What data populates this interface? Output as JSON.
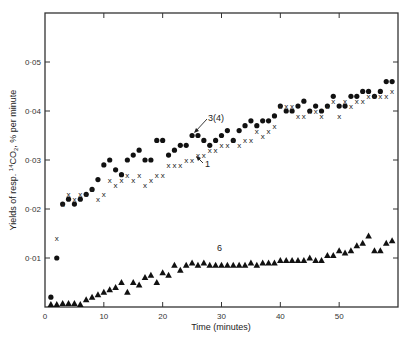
{
  "chart_data": {
    "type": "scatter",
    "title": "",
    "xlabel": "Time (minutes)",
    "ylabel": "Yields of resp. 14CO2, % per minute",
    "xlim": [
      0,
      60
    ],
    "ylim": [
      0,
      0.06
    ],
    "x_ticks": [
      0,
      10,
      20,
      30,
      40,
      50
    ],
    "x_tick_labels": [
      "0",
      "10",
      "20",
      "30",
      "40",
      "50"
    ],
    "y_ticks": [
      0.01,
      0.02,
      0.03,
      0.04,
      0.05
    ],
    "y_tick_labels": [
      "0·01",
      "0·02",
      "0·03",
      "0·04",
      "0·05"
    ],
    "grid": false,
    "legend": "none (inline annotations)",
    "annotations": [
      {
        "text": "3(4)",
        "x": 26,
        "y": 0.037,
        "arrow_to": [
          24,
          0.035
        ]
      },
      {
        "text": "1",
        "x": 27,
        "y": 0.031,
        "arrow_to": [
          25.5,
          0.033
        ]
      },
      {
        "text": "6",
        "x": 25,
        "y": 0.0125
      }
    ],
    "series": [
      {
        "name": "3(4)",
        "marker": "filled circle",
        "x": [
          1,
          2,
          3,
          4,
          5,
          6,
          7,
          8,
          9,
          10,
          11,
          12,
          13,
          14,
          15,
          16,
          17,
          18,
          19,
          20,
          21,
          22,
          23,
          24,
          25,
          26,
          27,
          28,
          29,
          30,
          31,
          32,
          33,
          34,
          35,
          36,
          37,
          38,
          39,
          40,
          41,
          42,
          43,
          44,
          45,
          46,
          47,
          48,
          49,
          50,
          51,
          52,
          53,
          54,
          55,
          56,
          57,
          58,
          59
        ],
        "y": [
          0.002,
          0.01,
          0.021,
          0.022,
          0.021,
          0.022,
          0.023,
          0.024,
          0.026,
          0.029,
          0.03,
          0.028,
          0.027,
          0.03,
          0.031,
          0.032,
          0.03,
          0.03,
          0.034,
          0.034,
          0.031,
          0.032,
          0.033,
          0.033,
          0.035,
          0.035,
          0.034,
          0.033,
          0.034,
          0.035,
          0.036,
          0.034,
          0.036,
          0.037,
          0.038,
          0.037,
          0.038,
          0.038,
          0.039,
          0.041,
          0.04,
          0.04,
          0.041,
          0.042,
          0.04,
          0.041,
          0.04,
          0.041,
          0.043,
          0.041,
          0.041,
          0.043,
          0.043,
          0.044,
          0.044,
          0.043,
          0.044,
          0.046,
          0.046
        ]
      },
      {
        "name": "1",
        "marker": "x",
        "x": [
          2,
          3,
          4,
          5,
          6,
          7,
          8,
          9,
          10,
          11,
          12,
          13,
          14,
          15,
          16,
          17,
          18,
          19,
          20,
          21,
          22,
          23,
          24,
          25,
          26,
          27,
          28,
          29,
          30,
          31,
          32,
          33,
          34,
          35,
          36,
          37,
          38,
          39,
          40,
          41,
          42,
          43,
          44,
          45,
          46,
          47,
          48,
          49,
          50,
          51,
          52,
          53,
          54,
          55,
          56,
          57,
          58,
          59
        ],
        "y": [
          0.014,
          0.021,
          0.023,
          0.022,
          0.023,
          0.023,
          0.024,
          0.022,
          0.023,
          0.026,
          0.025,
          0.026,
          0.027,
          0.026,
          0.027,
          0.025,
          0.026,
          0.027,
          0.027,
          0.029,
          0.029,
          0.029,
          0.03,
          0.03,
          0.031,
          0.031,
          0.032,
          0.032,
          0.033,
          0.033,
          0.034,
          0.033,
          0.034,
          0.034,
          0.036,
          0.035,
          0.036,
          0.037,
          0.041,
          0.041,
          0.041,
          0.039,
          0.039,
          0.04,
          0.04,
          0.039,
          0.041,
          0.042,
          0.039,
          0.042,
          0.041,
          0.042,
          0.042,
          0.043,
          0.043,
          0.043,
          0.043,
          0.044
        ]
      },
      {
        "name": "6",
        "marker": "filled triangle",
        "x": [
          1,
          2,
          3,
          4,
          5,
          6,
          7,
          8,
          9,
          10,
          11,
          12,
          13,
          14,
          15,
          16,
          17,
          18,
          19,
          20,
          21,
          22,
          23,
          24,
          25,
          26,
          27,
          28,
          29,
          30,
          31,
          32,
          33,
          34,
          35,
          36,
          37,
          38,
          39,
          40,
          41,
          42,
          43,
          44,
          45,
          46,
          47,
          48,
          49,
          50,
          51,
          52,
          53,
          54,
          55,
          56,
          57,
          58,
          59
        ],
        "y": [
          0.0005,
          0.0005,
          0.0007,
          0.0007,
          0.0007,
          0.0005,
          0.0015,
          0.002,
          0.0025,
          0.003,
          0.0035,
          0.004,
          0.005,
          0.003,
          0.005,
          0.0045,
          0.006,
          0.0065,
          0.005,
          0.007,
          0.0065,
          0.0085,
          0.0075,
          0.0085,
          0.009,
          0.0085,
          0.009,
          0.0085,
          0.0085,
          0.0085,
          0.0085,
          0.0085,
          0.0085,
          0.0085,
          0.009,
          0.0085,
          0.009,
          0.009,
          0.009,
          0.0095,
          0.0095,
          0.0095,
          0.0095,
          0.0095,
          0.01,
          0.0095,
          0.0095,
          0.0105,
          0.0105,
          0.0115,
          0.011,
          0.0115,
          0.0125,
          0.013,
          0.0145,
          0.0115,
          0.0115,
          0.013,
          0.0135
        ]
      }
    ]
  },
  "labels": {
    "xlabel": "Time (minutes)",
    "ylabel_pre": "Yields of resp. ",
    "ylabel_sup": "14",
    "ylabel_post": "CO",
    "ylabel_sub": "2",
    "ylabel_end": ", % per minute",
    "annot_34": "3(4)",
    "annot_1": "1",
    "annot_6": "6"
  }
}
